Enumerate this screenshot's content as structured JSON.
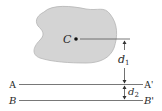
{
  "figure": {
    "area_shape": {
      "fill": "#d4d4d4",
      "stroke": "#b0b0b0"
    },
    "centroid": {
      "label": "C"
    },
    "axes": [
      {
        "left_label": "A",
        "right_label": "A'"
      },
      {
        "left_label": "B",
        "right_label": "B'"
      }
    ],
    "dimensions": [
      {
        "label": "d",
        "subscript": "1"
      },
      {
        "label": "d",
        "subscript": "2"
      }
    ],
    "line_color": "#555555"
  }
}
